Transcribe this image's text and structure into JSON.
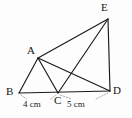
{
  "figure": {
    "type": "geometry-diagram",
    "background_color": "#fdfdfd",
    "line_color": "#1a1a1a",
    "guide_color": "#9a9a9a",
    "points": [
      {
        "id": "A",
        "label": "A",
        "x": 38,
        "y": 58,
        "label_x": 27,
        "label_y": 45
      },
      {
        "id": "B",
        "label": "B",
        "x": 19,
        "y": 93,
        "label_x": 6,
        "label_y": 86
      },
      {
        "id": "C",
        "label": "C",
        "x": 58,
        "y": 93,
        "label_x": 54,
        "label_y": 95
      },
      {
        "id": "D",
        "label": "D",
        "x": 110,
        "y": 91,
        "label_x": 113,
        "label_y": 85
      },
      {
        "id": "E",
        "label": "E",
        "x": 108,
        "y": 19,
        "label_x": 101,
        "label_y": 2
      }
    ],
    "segments": [
      {
        "id": "BD",
        "from": "B",
        "to": "D"
      },
      {
        "id": "AB",
        "from": "A",
        "to": "B"
      },
      {
        "id": "AC",
        "from": "A",
        "to": "C"
      },
      {
        "id": "AD",
        "from": "A",
        "to": "D"
      },
      {
        "id": "AE",
        "from": "A",
        "to": "E"
      },
      {
        "id": "CE",
        "from": "C",
        "to": "E"
      },
      {
        "id": "ED",
        "from": "E",
        "to": "D"
      }
    ],
    "dimensions": [
      {
        "id": "BC",
        "text": "4 cm",
        "value": 4,
        "unit": "cm",
        "from": "B",
        "to": "C",
        "label_x": 23,
        "label_y": 100
      },
      {
        "id": "CD",
        "text": "5 cm",
        "value": 5,
        "unit": "cm",
        "from": "C",
        "to": "D",
        "label_x": 67,
        "label_y": 100
      }
    ]
  }
}
